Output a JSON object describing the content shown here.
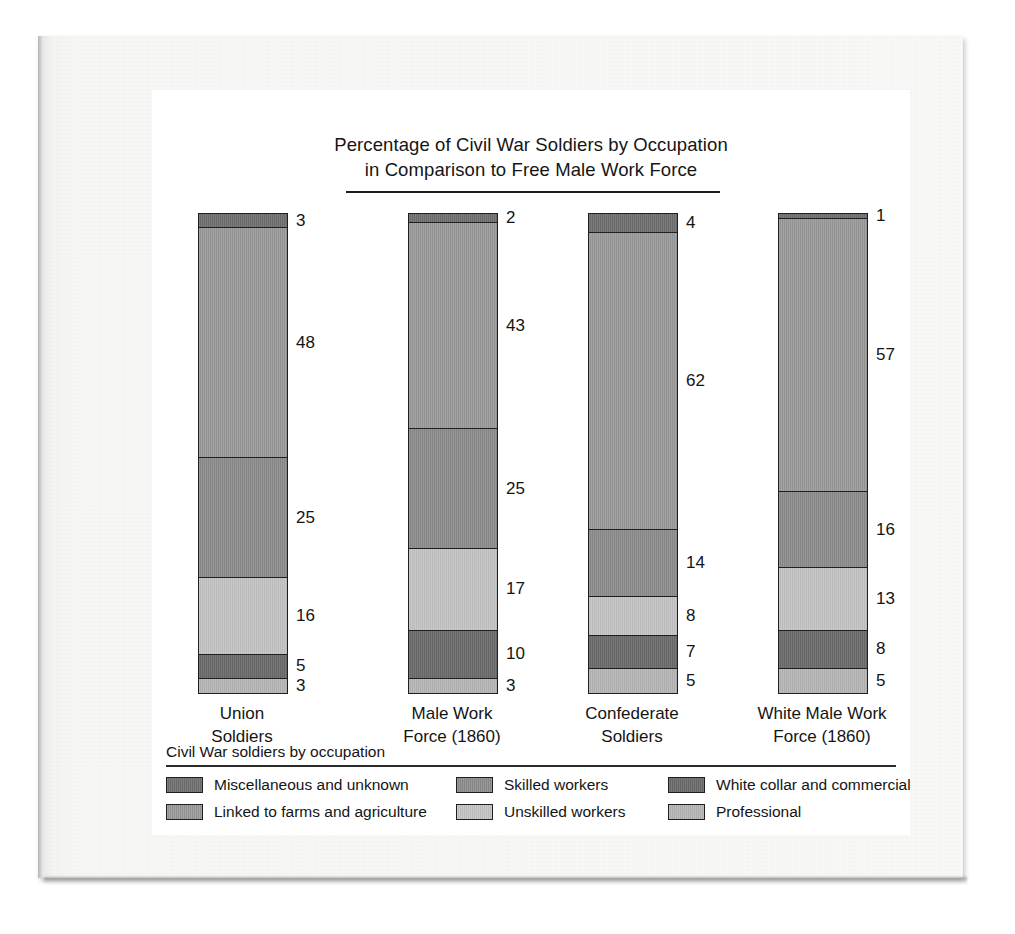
{
  "chart_data": {
    "type": "bar",
    "subtype": "stacked-column-100",
    "title": "Percentage of Civil War Soldiers by Occupation in Comparison to Free Male Work Force",
    "title_line1": "Percentage of Civil War Soldiers by Occupation",
    "title_line2": "in Comparison to Free Male Work Force",
    "xlabel": "",
    "ylabel": "",
    "ylim": [
      0,
      100
    ],
    "grid": false,
    "legend_position": "bottom",
    "legend_title": "Civil War soldiers by occupation",
    "categories": [
      "Union Soldiers",
      "Male Work Force (1860)",
      "Confederate Soldiers",
      "White Male Work Force (1860)"
    ],
    "category_lines": [
      [
        "Union",
        "Soldiers"
      ],
      [
        "Male Work",
        "Force (1860)"
      ],
      [
        "Confederate",
        "Soldiers"
      ],
      [
        "White Male Work",
        "Force (1860)"
      ]
    ],
    "series": [
      {
        "name": "Miscellaneous and unknown",
        "color": "#6f6f6f",
        "values": [
          3,
          2,
          4,
          1
        ]
      },
      {
        "name": "Linked to farms and agriculture",
        "color": "#9a9a9a",
        "values": [
          48,
          43,
          62,
          57
        ]
      },
      {
        "name": "Skilled workers",
        "color": "#8c8c8c",
        "values": [
          25,
          25,
          14,
          16
        ]
      },
      {
        "name": "Unskilled workers",
        "color": "#c4c4c4",
        "values": [
          16,
          17,
          8,
          13
        ]
      },
      {
        "name": "White collar and commercial",
        "color": "#6a6a6a",
        "values": [
          5,
          10,
          7,
          8
        ]
      },
      {
        "name": "Professional",
        "color": "#b6b6b6",
        "values": [
          3,
          3,
          5,
          5
        ]
      }
    ],
    "bars": [
      {
        "category_line1": "Union",
        "category_line2": "Soldiers",
        "segments": [
          {
            "label": "Miscellaneous and unknown",
            "value": 3,
            "display": "3",
            "color": "#6f6f6f"
          },
          {
            "label": "Linked to farms and agriculture",
            "value": 48,
            "display": "48",
            "color": "#9a9a9a"
          },
          {
            "label": "Skilled workers",
            "value": 25,
            "display": "25",
            "color": "#8c8c8c"
          },
          {
            "label": "Unskilled workers",
            "value": 16,
            "display": "16",
            "color": "#c4c4c4"
          },
          {
            "label": "White collar and commercial",
            "value": 5,
            "display": "5",
            "color": "#6a6a6a"
          },
          {
            "label": "Professional",
            "value": 3,
            "display": "3",
            "color": "#b6b6b6"
          }
        ]
      },
      {
        "category_line1": "Male Work",
        "category_line2": "Force (1860)",
        "segments": [
          {
            "label": "Miscellaneous and unknown",
            "value": 2,
            "display": "2",
            "color": "#6f6f6f"
          },
          {
            "label": "Linked to farms and agriculture",
            "value": 43,
            "display": "43",
            "color": "#9a9a9a"
          },
          {
            "label": "Skilled workers",
            "value": 25,
            "display": "25",
            "color": "#8c8c8c"
          },
          {
            "label": "Unskilled workers",
            "value": 17,
            "display": "17",
            "color": "#c4c4c4"
          },
          {
            "label": "White collar and commercial",
            "value": 10,
            "display": "10",
            "color": "#6a6a6a"
          },
          {
            "label": "Professional",
            "value": 3,
            "display": "3",
            "color": "#b6b6b6"
          }
        ]
      },
      {
        "category_line1": "Confederate",
        "category_line2": "Soldiers",
        "segments": [
          {
            "label": "Miscellaneous and unknown",
            "value": 4,
            "display": "4",
            "color": "#6f6f6f"
          },
          {
            "label": "Linked to farms and agriculture",
            "value": 62,
            "display": "62",
            "color": "#9a9a9a"
          },
          {
            "label": "Skilled workers",
            "value": 14,
            "display": "14",
            "color": "#8c8c8c"
          },
          {
            "label": "Unskilled workers",
            "value": 8,
            "display": "8",
            "color": "#c4c4c4"
          },
          {
            "label": "White collar and commercial",
            "value": 7,
            "display": "7",
            "color": "#6a6a6a"
          },
          {
            "label": "Professional",
            "value": 5,
            "display": "5",
            "color": "#b6b6b6"
          }
        ]
      },
      {
        "category_line1": "White Male Work",
        "category_line2": "Force (1860)",
        "segments": [
          {
            "label": "Miscellaneous and unknown",
            "value": 1,
            "display": "1",
            "color": "#6f6f6f"
          },
          {
            "label": "Linked to farms and agriculture",
            "value": 57,
            "display": "57",
            "color": "#9a9a9a"
          },
          {
            "label": "Skilled workers",
            "value": 16,
            "display": "16",
            "color": "#8c8c8c"
          },
          {
            "label": "Unskilled workers",
            "value": 13,
            "display": "13",
            "color": "#c4c4c4"
          },
          {
            "label": "White collar and commercial",
            "value": 8,
            "display": "8",
            "color": "#6a6a6a"
          },
          {
            "label": "Professional",
            "value": 5,
            "display": "5",
            "color": "#b6b6b6"
          }
        ]
      }
    ],
    "legend_entries": [
      {
        "label": "Miscellaneous and unknown",
        "color": "#6f6f6f"
      },
      {
        "label": "Skilled workers",
        "color": "#8c8c8c"
      },
      {
        "label": "White collar and commercial",
        "color": "#6a6a6a"
      },
      {
        "label": "Linked to farms and agriculture",
        "color": "#9a9a9a"
      },
      {
        "label": "Unskilled workers",
        "color": "#c4c4c4"
      },
      {
        "label": "Professional",
        "color": "#b6b6b6"
      }
    ]
  }
}
